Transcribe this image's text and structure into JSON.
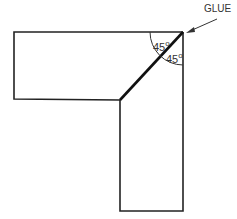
{
  "diagram": {
    "type": "miter-joint",
    "callout": {
      "label": "GLUE"
    },
    "angles": [
      {
        "label": "45",
        "unit": "o"
      },
      {
        "label": "45",
        "unit": "o"
      }
    ],
    "colors": {
      "stroke": "#222222",
      "background": "#ffffff"
    }
  }
}
